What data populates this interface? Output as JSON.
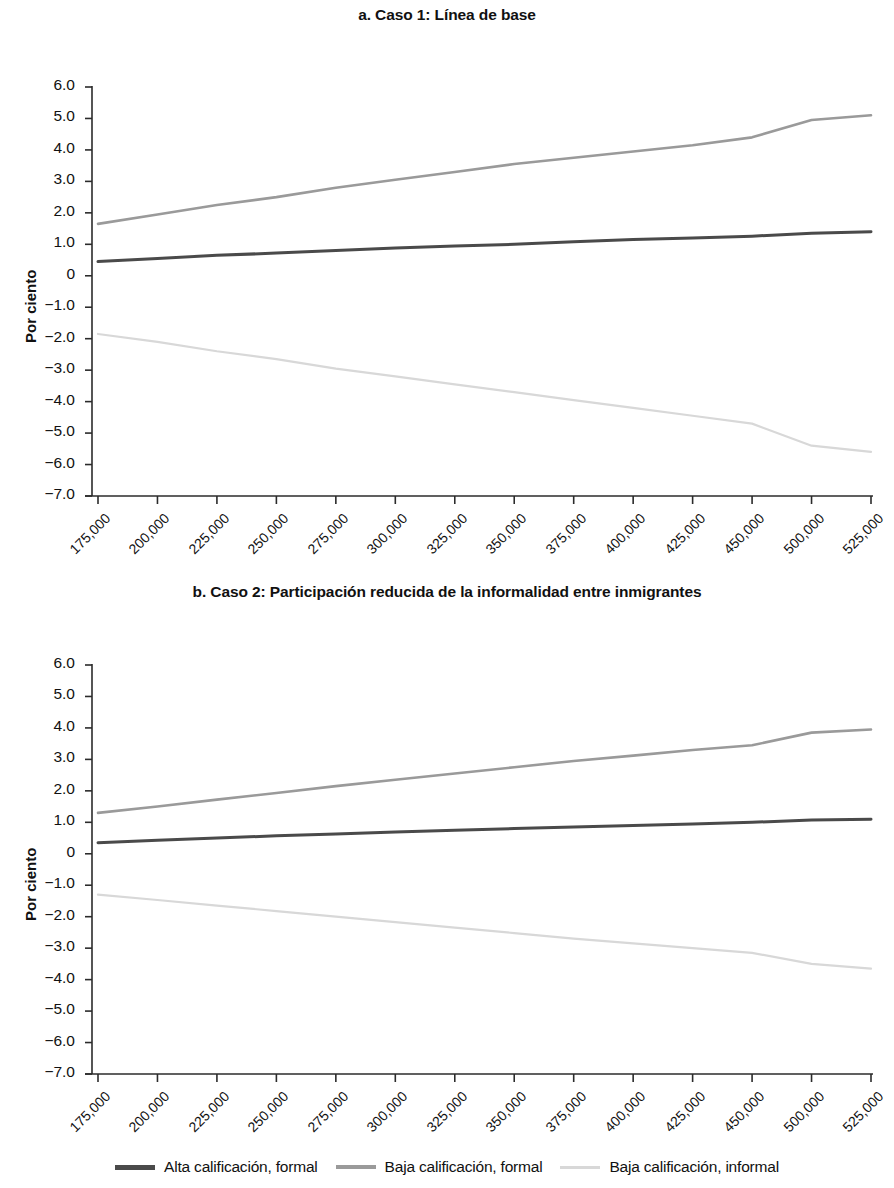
{
  "figure": {
    "y_axis_title": "Por ciento",
    "y_ticks": [
      "6.0",
      "5.0",
      "4.0",
      "3.0",
      "2.0",
      "1.0",
      "0",
      "−1.0",
      "−2.0",
      "−3.0",
      "−4.0",
      "−5.0",
      "−6.0",
      "−7.0"
    ],
    "x_ticks": [
      "175,000",
      "200,000",
      "225,000",
      "250,000",
      "275,000",
      "300,000",
      "325,000",
      "350,000",
      "375,000",
      "400,000",
      "425,000",
      "450,000",
      "500,000",
      "525,000"
    ]
  },
  "legend": {
    "items": [
      {
        "label": "Alta calificación, formal",
        "color": "#4a4a4a"
      },
      {
        "label": "Baja calificación, formal",
        "color": "#9a9a9a"
      },
      {
        "label": "Baja calificación, informal",
        "color": "#d8d8d8"
      }
    ]
  },
  "chart_data": [
    {
      "type": "line",
      "panel": "a",
      "title": "a. Caso 1:  Línea de base",
      "xlabel": "",
      "ylabel": "Por ciento",
      "ylim": [
        -7.0,
        6.0
      ],
      "ytick_values": [
        6.0,
        5.0,
        4.0,
        3.0,
        2.0,
        1.0,
        0.0,
        -1.0,
        -2.0,
        -3.0,
        -4.0,
        -5.0,
        -6.0,
        -7.0
      ],
      "x": [
        "175,000",
        "200,000",
        "225,000",
        "250,000",
        "275,000",
        "300,000",
        "325,000",
        "350,000",
        "375,000",
        "400,000",
        "425,000",
        "450,000",
        "500,000",
        "525,000"
      ],
      "grid": false,
      "legend_position": "bottom",
      "series": [
        {
          "name": "Alta calificación, formal",
          "color": "#4a4a4a",
          "values": [
            0.45,
            0.55,
            0.65,
            0.72,
            0.8,
            0.88,
            0.95,
            1.0,
            1.08,
            1.15,
            1.2,
            1.26,
            1.35,
            1.4
          ]
        },
        {
          "name": "Baja calificación, formal",
          "color": "#9a9a9a",
          "values": [
            1.65,
            1.95,
            2.25,
            2.5,
            2.8,
            3.05,
            3.3,
            3.55,
            3.75,
            3.95,
            4.15,
            4.4,
            4.95,
            5.1
          ]
        },
        {
          "name": "Baja calificación, informal",
          "color": "#d8d8d8",
          "values": [
            -1.85,
            -2.1,
            -2.4,
            -2.65,
            -2.95,
            -3.2,
            -3.45,
            -3.7,
            -3.95,
            -4.2,
            -4.45,
            -4.7,
            -5.4,
            -5.6
          ]
        }
      ]
    },
    {
      "type": "line",
      "panel": "b",
      "title": "b. Caso 2:  Participación reducida de la informalidad entre inmigrantes",
      "xlabel": "",
      "ylabel": "Por ciento",
      "ylim": [
        -7.0,
        6.0
      ],
      "ytick_values": [
        6.0,
        5.0,
        4.0,
        3.0,
        2.0,
        1.0,
        0.0,
        -1.0,
        -2.0,
        -3.0,
        -4.0,
        -5.0,
        -6.0,
        -7.0
      ],
      "x": [
        "175,000",
        "200,000",
        "225,000",
        "250,000",
        "275,000",
        "300,000",
        "325,000",
        "350,000",
        "375,000",
        "400,000",
        "425,000",
        "450,000",
        "500,000",
        "525,000"
      ],
      "grid": false,
      "legend_position": "bottom",
      "series": [
        {
          "name": "Alta calificación, formal",
          "color": "#4a4a4a",
          "values": [
            0.35,
            0.43,
            0.5,
            0.57,
            0.63,
            0.69,
            0.75,
            0.8,
            0.85,
            0.9,
            0.95,
            1.0,
            1.07,
            1.1
          ]
        },
        {
          "name": "Baja calificación, formal",
          "color": "#9a9a9a",
          "values": [
            1.3,
            1.5,
            1.72,
            1.93,
            2.15,
            2.35,
            2.55,
            2.75,
            2.95,
            3.12,
            3.3,
            3.45,
            3.85,
            3.95
          ]
        },
        {
          "name": "Baja calificación, informal",
          "color": "#d8d8d8",
          "values": [
            -1.3,
            -1.47,
            -1.65,
            -1.82,
            -2.0,
            -2.17,
            -2.35,
            -2.52,
            -2.7,
            -2.85,
            -3.0,
            -3.15,
            -3.5,
            -3.65
          ]
        }
      ]
    }
  ]
}
